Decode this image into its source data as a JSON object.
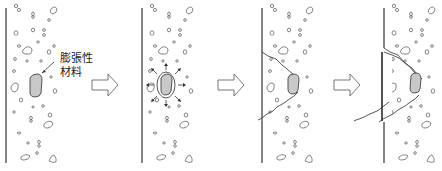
{
  "diagram": {
    "type": "process-sequence",
    "stages": [
      {
        "id": 1,
        "description": "expansive material embedded in concrete"
      },
      {
        "id": 2,
        "description": "expansive material expands, radiating pressure"
      },
      {
        "id": 3,
        "description": "crack forms toward surface"
      },
      {
        "id": 4,
        "description": "cone-shaped spall (popout) breaks off"
      }
    ],
    "label": {
      "line1": "膨張性",
      "line2": "材料"
    },
    "arrows": 3,
    "colors": {
      "line": "#333333",
      "material_fill": "#c8c8c8",
      "aggregate": "#666666"
    }
  }
}
